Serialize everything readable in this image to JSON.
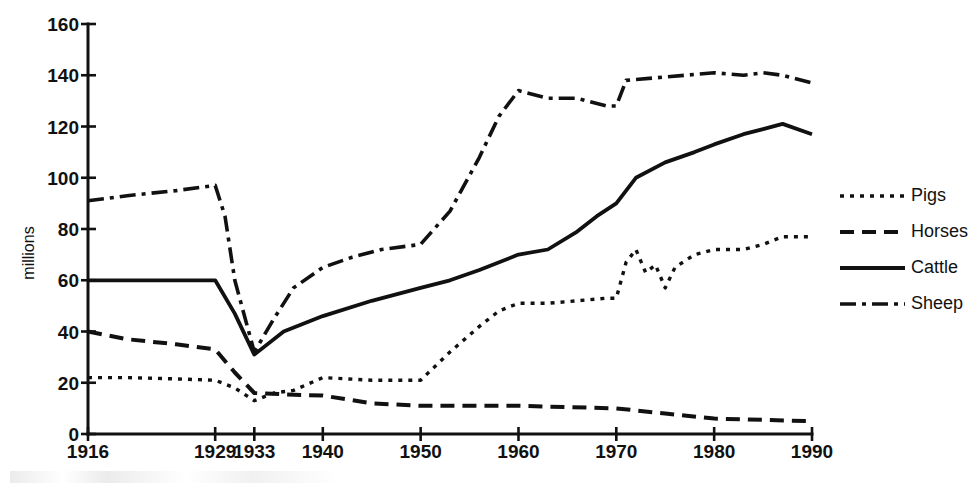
{
  "chart_data": {
    "type": "line",
    "title": "",
    "subtitle": "",
    "xlabel": "",
    "ylabel": "millions",
    "xlim": [
      1916,
      1990
    ],
    "ylim": [
      0,
      160
    ],
    "grid": false,
    "legend_position": "right",
    "x_tick_labels": [
      "1916",
      "1929",
      "1933",
      "1940",
      "1950",
      "1960",
      "1970",
      "1980",
      "1990"
    ],
    "x_ticks": [
      1916,
      1929,
      1933,
      1940,
      1950,
      1960,
      1970,
      1980,
      1990
    ],
    "y_tick_labels": [
      "0",
      "20",
      "40",
      "60",
      "80",
      "100",
      "120",
      "140",
      "160"
    ],
    "y_ticks": [
      0,
      20,
      40,
      60,
      80,
      100,
      120,
      140,
      160
    ],
    "series": [
      {
        "name": "Pigs",
        "style": "dotted",
        "x": [
          1916,
          1920,
          1925,
          1929,
          1931,
          1933,
          1935,
          1937,
          1940,
          1945,
          1950,
          1953,
          1956,
          1958,
          1960,
          1963,
          1966,
          1969,
          1970,
          1971,
          1972,
          1973,
          1974,
          1975,
          1976,
          1978,
          1980,
          1983,
          1985,
          1987,
          1990
        ],
        "values": [
          22,
          22,
          21.5,
          21,
          18,
          13,
          16,
          17,
          22,
          21,
          21,
          32,
          42,
          48,
          51,
          51,
          52,
          53,
          53,
          67,
          72,
          63,
          66,
          57,
          65,
          70,
          72,
          72,
          74,
          77,
          77
        ]
      },
      {
        "name": "Horses",
        "style": "dashed",
        "x": [
          1916,
          1920,
          1925,
          1929,
          1931,
          1933,
          1936,
          1940,
          1945,
          1950,
          1955,
          1960,
          1965,
          1970,
          1975,
          1980,
          1985,
          1990
        ],
        "values": [
          40,
          37,
          35,
          33,
          24,
          16,
          15.5,
          15,
          12,
          11,
          11,
          11,
          10.5,
          10,
          8,
          6,
          5.5,
          5
        ]
      },
      {
        "name": "Cattle",
        "style": "solid",
        "x": [
          1916,
          1922,
          1929,
          1931,
          1933,
          1936,
          1940,
          1945,
          1950,
          1953,
          1956,
          1960,
          1963,
          1966,
          1968,
          1970,
          1972,
          1975,
          1978,
          1980,
          1983,
          1985,
          1987,
          1990
        ],
        "values": [
          60,
          60,
          60,
          47,
          31,
          40,
          46,
          52,
          57,
          60,
          64,
          70,
          72,
          79,
          85,
          90,
          100,
          106,
          110,
          113,
          117,
          119,
          121,
          117
        ]
      },
      {
        "name": "Sheep",
        "style": "dash-dot",
        "x": [
          1916,
          1920,
          1925,
          1929,
          1930,
          1931,
          1933,
          1935,
          1937,
          1940,
          1943,
          1946,
          1950,
          1953,
          1956,
          1958,
          1960,
          1963,
          1966,
          1969,
          1970,
          1971,
          1974,
          1977,
          1980,
          1983,
          1985,
          1987,
          1990
        ],
        "values": [
          91,
          93,
          95,
          97,
          85,
          60,
          32,
          45,
          57,
          65,
          69,
          72,
          74,
          87,
          108,
          124,
          134,
          131,
          131,
          128,
          128,
          138,
          139,
          140,
          141,
          140,
          141,
          140,
          137
        ]
      }
    ]
  },
  "legend": {
    "items": [
      {
        "label": "Pigs",
        "style": "dotted"
      },
      {
        "label": "Horses",
        "style": "dashed"
      },
      {
        "label": "Cattle",
        "style": "solid"
      },
      {
        "label": "Sheep",
        "style": "dash-dot"
      }
    ]
  },
  "colors": {
    "ink": "#111111",
    "background": "#ffffff"
  }
}
